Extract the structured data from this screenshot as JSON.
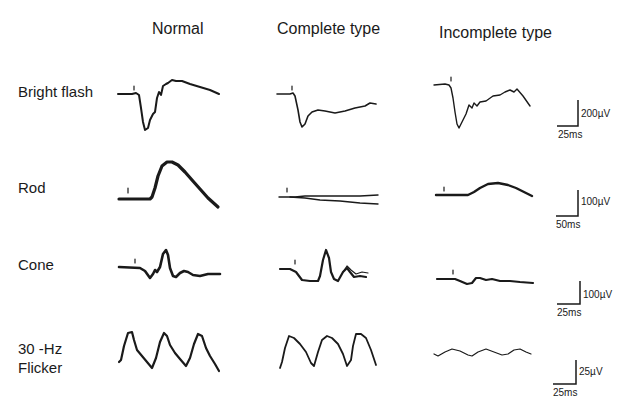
{
  "columns": [
    {
      "label": "Normal"
    },
    {
      "label": "Complete type"
    },
    {
      "label": "Incomplete type"
    }
  ],
  "rows": [
    {
      "label": "Bright flash",
      "scale": {
        "voltage": "200µV",
        "time": "25ms"
      }
    },
    {
      "label": "Rod",
      "scale": {
        "voltage": "100µV",
        "time": "50ms"
      }
    },
    {
      "label": "Cone",
      "scale": {
        "voltage": "100µV",
        "time": "25ms"
      }
    },
    {
      "label_line1": "30 -Hz",
      "label_line2": "Flicker",
      "scale": {
        "voltage": "25µV",
        "time": "25ms"
      }
    }
  ],
  "stimulus_marker": "▼"
}
